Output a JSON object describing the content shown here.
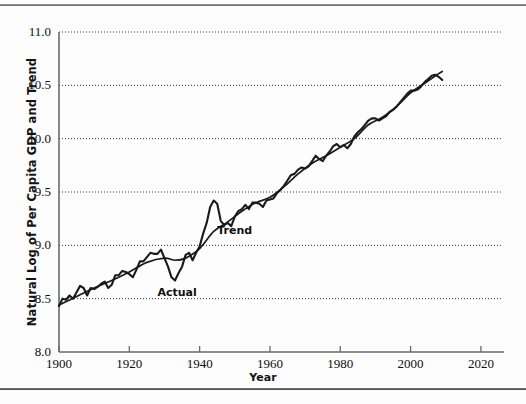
{
  "figure": {
    "background": "#fdfdfd",
    "has_top_rule": true,
    "has_bottom_rule": true
  },
  "chart_data": {
    "type": "line",
    "title": "",
    "xlabel": "Year",
    "ylabel": "Natural Log of Per Capita GDP and Trend",
    "xlim": [
      1900,
      2026
    ],
    "ylim": [
      8.0,
      11.0
    ],
    "xticks": [
      1900,
      1920,
      1940,
      1960,
      1980,
      2000,
      2020
    ],
    "yticks": [
      8.0,
      8.5,
      9.0,
      9.5,
      10.0,
      10.5,
      11.0
    ],
    "ytick_labels": [
      "8.0",
      "8.5",
      "9.0",
      "9.5",
      "10.0",
      "10.5",
      "11.0"
    ],
    "xtick_labels": [
      "1900",
      "1920",
      "1940",
      "1960",
      "1980",
      "2000",
      "2020"
    ],
    "grid": "horizontal-dotted",
    "grid_color": "#333333",
    "legend": "inline-annotations",
    "annotations": [
      {
        "text": "Actual",
        "x": 1928,
        "y": 8.62
      },
      {
        "text": "Trend",
        "x": 1945,
        "y": 9.2
      }
    ],
    "line_color": "#1a1a1a",
    "series": [
      {
        "name": "Actual",
        "x": [
          1900,
          1901,
          1902,
          1903,
          1904,
          1905,
          1906,
          1907,
          1908,
          1909,
          1910,
          1911,
          1912,
          1913,
          1914,
          1915,
          1916,
          1917,
          1918,
          1919,
          1920,
          1921,
          1922,
          1923,
          1924,
          1925,
          1926,
          1927,
          1928,
          1929,
          1930,
          1931,
          1932,
          1933,
          1934,
          1935,
          1936,
          1937,
          1938,
          1939,
          1940,
          1941,
          1942,
          1943,
          1944,
          1945,
          1946,
          1947,
          1948,
          1949,
          1950,
          1951,
          1952,
          1953,
          1954,
          1955,
          1956,
          1957,
          1958,
          1959,
          1960,
          1961,
          1962,
          1963,
          1964,
          1965,
          1966,
          1967,
          1968,
          1969,
          1970,
          1971,
          1972,
          1973,
          1974,
          1975,
          1976,
          1977,
          1978,
          1979,
          1980,
          1981,
          1982,
          1983,
          1984,
          1985,
          1986,
          1987,
          1988,
          1989,
          1990,
          1991,
          1992,
          1993,
          1994,
          1995,
          1996,
          1997,
          1998,
          1999,
          2000,
          2001,
          2002,
          2003,
          2004,
          2005,
          2006,
          2007,
          2008,
          2009
        ],
        "y": [
          8.43,
          8.5,
          8.49,
          8.53,
          8.5,
          8.56,
          8.62,
          8.6,
          8.53,
          8.6,
          8.59,
          8.61,
          8.64,
          8.66,
          8.6,
          8.63,
          8.72,
          8.72,
          8.76,
          8.75,
          8.73,
          8.7,
          8.77,
          8.85,
          8.85,
          8.89,
          8.93,
          8.92,
          8.92,
          8.96,
          8.88,
          8.8,
          8.7,
          8.67,
          8.74,
          8.8,
          8.91,
          8.93,
          8.86,
          8.93,
          8.99,
          9.11,
          9.21,
          9.36,
          9.42,
          9.39,
          9.23,
          9.19,
          9.21,
          9.18,
          9.27,
          9.32,
          9.34,
          9.38,
          9.34,
          9.4,
          9.4,
          9.39,
          9.36,
          9.42,
          9.43,
          9.44,
          9.49,
          9.52,
          9.56,
          9.61,
          9.66,
          9.67,
          9.71,
          9.73,
          9.72,
          9.74,
          9.79,
          9.84,
          9.81,
          9.79,
          9.84,
          9.88,
          9.93,
          9.95,
          9.92,
          9.94,
          9.91,
          9.95,
          10.02,
          10.06,
          10.09,
          10.13,
          10.17,
          10.19,
          10.19,
          10.17,
          10.19,
          10.21,
          10.25,
          10.27,
          10.3,
          10.34,
          10.38,
          10.42,
          10.45,
          10.45,
          10.46,
          10.49,
          10.53,
          10.56,
          10.59,
          10.6,
          10.58,
          10.55
        ]
      },
      {
        "name": "Trend",
        "x": [
          1900,
          1905,
          1910,
          1915,
          1920,
          1925,
          1930,
          1933,
          1936,
          1940,
          1944,
          1948,
          1952,
          1956,
          1960,
          1964,
          1968,
          1972,
          1976,
          1980,
          1984,
          1988,
          1992,
          1996,
          2000,
          2004,
          2008,
          2009
        ],
        "y": [
          8.44,
          8.52,
          8.6,
          8.67,
          8.75,
          8.84,
          8.88,
          8.86,
          8.88,
          8.97,
          9.13,
          9.22,
          9.32,
          9.4,
          9.45,
          9.55,
          9.67,
          9.77,
          9.84,
          9.92,
          10.0,
          10.13,
          10.2,
          10.3,
          10.43,
          10.52,
          10.61,
          10.63
        ]
      }
    ]
  },
  "axis": {
    "spine_color": "#6a6a6a"
  }
}
